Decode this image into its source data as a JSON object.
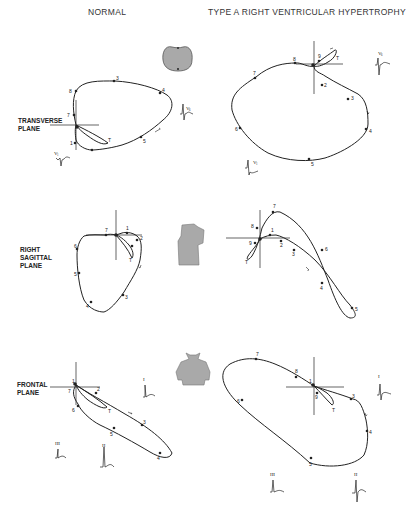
{
  "headers": {
    "left": "NORMAL",
    "right": "TYPE A RIGHT VENTRICULAR HYPERTROPHY"
  },
  "planes": [
    {
      "id": "transverse",
      "label": "TRANSVERSE\nPLANE"
    },
    {
      "id": "sagittal",
      "label": "RIGHT\nSAGITTAL\nPLANE"
    },
    {
      "id": "frontal",
      "label": "FRONTAL\nPLANE"
    }
  ],
  "icons": {
    "transverse": "torso-cross-section-icon",
    "sagittal": "torso-side-view-icon",
    "frontal": "torso-front-view-icon"
  },
  "leads": {
    "normal_transverse": [
      "V1",
      "V6"
    ],
    "rvh_transverse": [
      "V1",
      "V6"
    ],
    "normal_frontal": [
      "I",
      "II",
      "III"
    ],
    "rvh_frontal": [
      "I",
      "II",
      "III"
    ]
  },
  "loop_markers": {
    "normal_transverse": [
      "1",
      "3",
      "5",
      "6",
      "7",
      "8",
      "T"
    ],
    "rvh_transverse": [
      "2",
      "3",
      "4",
      "5",
      "6",
      "7",
      "8",
      "9",
      "T"
    ],
    "normal_sagittal": [
      "1",
      "2",
      "3",
      "4",
      "5",
      "6",
      "7",
      "T"
    ],
    "rvh_sagittal": [
      "1",
      "2",
      "3",
      "4",
      "5",
      "6",
      "7",
      "8",
      "9",
      "T"
    ],
    "normal_frontal": [
      "1",
      "2",
      "3",
      "4",
      "5",
      "6",
      "7",
      "T"
    ],
    "rvh_frontal": [
      "1",
      "3",
      "4",
      "5",
      "6",
      "7",
      "8",
      "9",
      "T"
    ]
  },
  "colors": {
    "line": "#222222",
    "torso_fill": "#a9a9a9"
  }
}
